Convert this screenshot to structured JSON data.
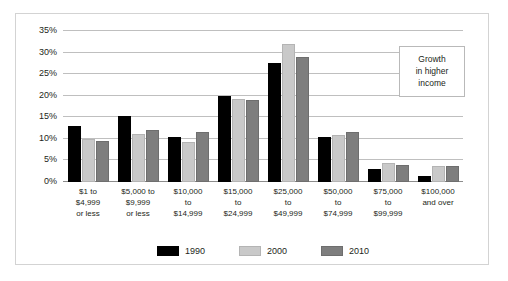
{
  "chart_data": {
    "type": "bar",
    "title": "",
    "xlabel": "",
    "ylabel": "",
    "ylim": [
      0,
      35
    ],
    "ytick_values": [
      0,
      5,
      10,
      15,
      20,
      25,
      30,
      35
    ],
    "ytick_labels": [
      "0%",
      "5%",
      "10%",
      "15%",
      "20%",
      "25%",
      "30%",
      "35%"
    ],
    "grid": true,
    "legend_position": "bottom",
    "categories": [
      "$1 to\n$4,999\nor less",
      "$5,000 to\n$9,999\nor less",
      "$10,000\nto\n$14,999",
      "$15,000\nto\n$24,999",
      "$25,000\nto\n$49,999",
      "$50,000\nto\n$74,999",
      "$75,000\nto\n$99,999",
      "$100,000\nand over"
    ],
    "category_lines": [
      [
        "$1 to",
        "$4,999",
        "or less"
      ],
      [
        "$5,000 to",
        "$9,999",
        "or less"
      ],
      [
        "$10,000",
        "to",
        "$14,999"
      ],
      [
        "$15,000",
        "to",
        "$24,999"
      ],
      [
        "$25,000",
        "to",
        "$49,999"
      ],
      [
        "$50,000",
        "to",
        "$74,999"
      ],
      [
        "$75,000",
        "to",
        "$99,999"
      ],
      [
        "$100,000",
        "and over",
        ""
      ]
    ],
    "series": [
      {
        "name": "1990",
        "color": "#000000",
        "values": [
          13.0,
          15.2,
          10.5,
          20.0,
          27.5,
          10.5,
          3.0,
          1.3
        ]
      },
      {
        "name": "2000",
        "color": "#c9c9c9",
        "values": [
          10.0,
          11.2,
          9.3,
          19.3,
          32.0,
          11.0,
          4.5,
          3.8
        ]
      },
      {
        "name": "2010",
        "color": "#7e7e7e",
        "values": [
          9.5,
          12.0,
          11.5,
          19.0,
          29.0,
          11.5,
          4.0,
          3.8
        ]
      }
    ],
    "annotations": [
      {
        "id": "growth-callout",
        "lines": [
          "Growth",
          "in higher",
          "income"
        ]
      }
    ]
  },
  "legend": {
    "items": [
      {
        "label": "1990"
      },
      {
        "label": "2000"
      },
      {
        "label": "2010"
      }
    ]
  }
}
